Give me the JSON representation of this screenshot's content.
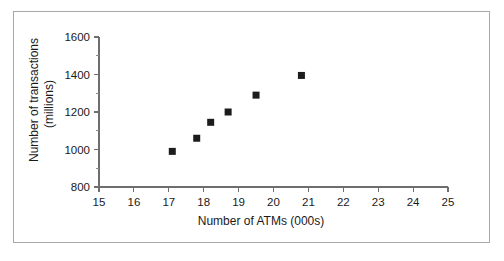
{
  "figure": {
    "background_color": "#ffffff",
    "border_color": "#a8a8a8",
    "axis_color": "#6e6e6e",
    "marker_color": "#1c1c1c",
    "text_color": "#1a1a1a"
  },
  "chart_data": {
    "type": "scatter",
    "title": "",
    "xlabel": "Number of ATMs (000s)",
    "ylabel_line1": "Number of transactions",
    "ylabel_line2": "(millions)",
    "ylabel": "Number of transactions (millions)",
    "xlim": [
      15,
      25
    ],
    "ylim": [
      800,
      1600
    ],
    "xticks": [
      15,
      16,
      17,
      18,
      19,
      20,
      21,
      22,
      23,
      24,
      25
    ],
    "xtick_labels": [
      "15",
      "16",
      "17",
      "18",
      "19",
      "20",
      "21",
      "22",
      "23",
      "24",
      "25"
    ],
    "yticks": [
      800,
      1000,
      1200,
      1400,
      1600
    ],
    "ytick_labels": [
      "800",
      "1000",
      "1200",
      "1400",
      "1600"
    ],
    "y_minor_ticks": [
      900,
      1100,
      1300,
      1500
    ],
    "grid": false,
    "legend": false,
    "marker": "square",
    "marker_size": 7,
    "points": [
      {
        "x": 17.1,
        "y": 990
      },
      {
        "x": 17.8,
        "y": 1060
      },
      {
        "x": 18.2,
        "y": 1145
      },
      {
        "x": 18.7,
        "y": 1200
      },
      {
        "x": 19.5,
        "y": 1290
      },
      {
        "x": 20.8,
        "y": 1395
      }
    ],
    "series": [
      {
        "name": "ATMs vs transactions",
        "x": [
          17.1,
          17.8,
          18.2,
          18.7,
          19.5,
          20.8
        ],
        "values": [
          990,
          1060,
          1145,
          1200,
          1290,
          1395
        ]
      }
    ]
  }
}
